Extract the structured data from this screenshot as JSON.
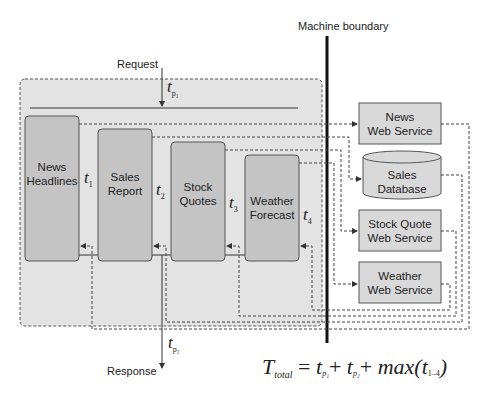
{
  "diagram": {
    "labels": {
      "request": "Request",
      "response": "Response",
      "machine_boundary": "Machine boundary"
    },
    "timing": {
      "tp1": "t",
      "tp1_sub": "p₁",
      "tp2": "t",
      "tp2_sub": "p₂"
    },
    "components": [
      {
        "id": "news-headlines",
        "line1": "News",
        "line2": "Headlines",
        "t": "t",
        "t_sub": "1"
      },
      {
        "id": "sales-report",
        "line1": "Sales",
        "line2": "Report",
        "t": "t",
        "t_sub": "2"
      },
      {
        "id": "stock-quotes",
        "line1": "Stock",
        "line2": "Quotes",
        "t": "t",
        "t_sub": "3"
      },
      {
        "id": "weather-forecast",
        "line1": "Weather",
        "line2": "Forecast",
        "t": "t",
        "t_sub": "4"
      }
    ],
    "services": [
      {
        "id": "news-web-service",
        "line1": "News",
        "line2": "Web Service",
        "shape": "rect"
      },
      {
        "id": "sales-database",
        "line1": "Sales",
        "line2": "Database",
        "shape": "cylinder"
      },
      {
        "id": "stock-quote-web-service",
        "line1": "Stock Quote",
        "line2": "Web Service",
        "shape": "rect"
      },
      {
        "id": "weather-web-service",
        "line1": "Weather",
        "line2": "Web Service",
        "shape": "rect"
      }
    ],
    "formula": {
      "T": "T",
      "T_sub": "total",
      "eq": "=",
      "tp": "t",
      "p1": "p₁",
      "p2": "p₂",
      "plus": "+",
      "max": "max(",
      "t": "t",
      "range": "1–4",
      "close": ")"
    },
    "colors": {
      "container_fill": "#e3e3e3",
      "component_fill": "#c4c4c4",
      "service_fill": "#d9d9d9",
      "stroke": "#444444",
      "boundary": "#111111"
    }
  }
}
